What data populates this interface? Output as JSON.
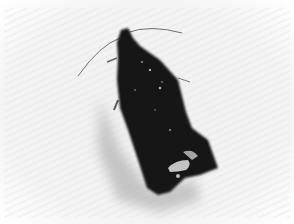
{
  "image": {
    "subject": "moth",
    "description": "Dark moth resting on a white textured surface, casting a grey shadow",
    "colors": {
      "background": "#f4f4f4",
      "background_edge": "#ffffff",
      "shadow": "#b8b8b8",
      "moth_body": "#141414",
      "moth_highlight": "#d8d8d8",
      "antenna": "#6a6a6a"
    }
  }
}
